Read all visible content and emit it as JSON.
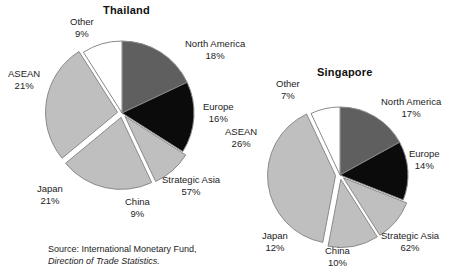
{
  "figure": {
    "source_line1": "Source: International Monetary Fund,",
    "source_line2": "Direction of Trade Statistics."
  },
  "charts": [
    {
      "key": "thailand",
      "title": "Thailand",
      "title_pos": {
        "x": 103,
        "y": 4
      },
      "center": {
        "x": 122,
        "y": 113
      },
      "radius": 72,
      "labels": [
        {
          "name": "north-america",
          "text": "North America",
          "pct": "18%",
          "x": 185,
          "y": 38,
          "align": "l"
        },
        {
          "name": "europe",
          "text": "Europe",
          "pct": "16%",
          "x": 203,
          "y": 101,
          "align": "l"
        },
        {
          "name": "strategic-asia",
          "text": "Strategic Asia",
          "pct": "57%",
          "x": 162,
          "y": 174,
          "align": "l"
        },
        {
          "name": "china",
          "text": "China",
          "pct": "9%",
          "x": 125,
          "y": 196,
          "align": "l"
        },
        {
          "name": "japan",
          "text": "Japan",
          "pct": "21%",
          "x": 37,
          "y": 183,
          "align": "l"
        },
        {
          "name": "asean",
          "text": "ASEAN",
          "pct": "21%",
          "x": 8,
          "y": 68,
          "align": "l"
        },
        {
          "name": "other",
          "text": "Other",
          "pct": "9%",
          "x": 70,
          "y": 16,
          "align": "l"
        }
      ]
    },
    {
      "key": "singapore",
      "title": "Singapore",
      "title_pos": {
        "x": 317,
        "y": 66
      },
      "center": {
        "x": 340,
        "y": 175
      },
      "radius": 68,
      "labels": [
        {
          "name": "north-america",
          "text": "North America",
          "pct": "17%",
          "x": 381,
          "y": 96,
          "align": "l"
        },
        {
          "name": "europe",
          "text": "Europe",
          "pct": "14%",
          "x": 409,
          "y": 148,
          "align": "l"
        },
        {
          "name": "strategic-asia",
          "text": "Strategic Asia",
          "pct": "62%",
          "x": 381,
          "y": 230,
          "align": "l"
        },
        {
          "name": "china",
          "text": "China",
          "pct": "10%",
          "x": 325,
          "y": 245,
          "align": "l"
        },
        {
          "name": "japan",
          "text": "Japan",
          "pct": "12%",
          "x": 262,
          "y": 230,
          "align": "l"
        },
        {
          "name": "asean",
          "text": "ASEAN",
          "pct": "26%",
          "x": 225,
          "y": 126,
          "align": "l"
        },
        {
          "name": "other",
          "text": "Other",
          "pct": "7%",
          "x": 276,
          "y": 78,
          "align": "l"
        }
      ]
    }
  ],
  "chart_data": [
    {
      "type": "pie",
      "title": "Thailand",
      "categories": [
        "North America",
        "Europe",
        "Strategic Asia",
        "China",
        "Japan",
        "ASEAN",
        "Other"
      ],
      "values": [
        18,
        16,
        57,
        9,
        21,
        21,
        9
      ],
      "notes": "Strategic Asia (57%) is a bracket label grouping China (9%), Japan (21%) and ASEAN (26% shown as 21%) slices; the drawn slices are North America, Europe, China, Japan, ASEAN and Other.",
      "slices": [
        {
          "label": "North America",
          "value": 18,
          "color": "#5f5f5f",
          "exploded": false
        },
        {
          "label": "Europe",
          "value": 16,
          "color": "#0b0b0b",
          "exploded": false
        },
        {
          "label": "China",
          "value": 9,
          "color": "#bfbfbf",
          "exploded": true
        },
        {
          "label": "Japan",
          "value": 21,
          "color": "#bfbfbf",
          "exploded": true
        },
        {
          "label": "ASEAN",
          "value": 27,
          "color": "#bfbfbf",
          "exploded": true
        },
        {
          "label": "Other",
          "value": 9,
          "color": "#ffffff",
          "exploded": false
        }
      ],
      "grouped_label": {
        "label": "Strategic Asia",
        "value": 57
      },
      "legend": "none",
      "xlabel": "",
      "ylabel": ""
    },
    {
      "type": "pie",
      "title": "Singapore",
      "categories": [
        "North America",
        "Europe",
        "Strategic Asia",
        "China",
        "Japan",
        "ASEAN",
        "Other"
      ],
      "values": [
        17,
        14,
        62,
        10,
        12,
        26,
        7
      ],
      "notes": "Strategic Asia (62%) is a bracket label grouping China (10%), Japan (12%) and ASEAN (26%) slices; the drawn slices are North America, Europe, China, Japan, ASEAN and Other.",
      "slices": [
        {
          "label": "North America",
          "value": 17,
          "color": "#5f5f5f",
          "exploded": false
        },
        {
          "label": "Europe",
          "value": 14,
          "color": "#0b0b0b",
          "exploded": false
        },
        {
          "label": "China",
          "value": 10,
          "color": "#bfbfbf",
          "exploded": true
        },
        {
          "label": "Japan",
          "value": 12,
          "color": "#bfbfbf",
          "exploded": true
        },
        {
          "label": "ASEAN",
          "value": 40,
          "color": "#bfbfbf",
          "exploded": true
        },
        {
          "label": "Other",
          "value": 7,
          "color": "#ffffff",
          "exploded": false
        }
      ],
      "grouped_label": {
        "label": "Strategic Asia",
        "value": 62
      },
      "legend": "none",
      "xlabel": "",
      "ylabel": ""
    }
  ],
  "colors": {
    "north_america": "#5f5f5f",
    "europe": "#0b0b0b",
    "asia_group": "#bfbfbf",
    "other": "#ffffff",
    "outline": "#8a8a8a",
    "text": "#1c1c1c"
  }
}
